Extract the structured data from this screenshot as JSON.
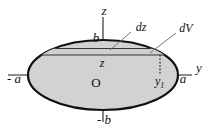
{
  "figure": {
    "background_color": "#ffffff",
    "fill_color": "#d2d2d2",
    "outline_color": "#111111",
    "axis_color": "#555555",
    "labels": {
      "z_axis": "z",
      "y_axis": "y",
      "semi_minor_top": "b",
      "semi_minor_bottom": "- b",
      "semi_major_left": "- a",
      "semi_major_right": "a",
      "origin": "O",
      "height_level": "z",
      "thickness": "dz",
      "volume_element": "dV",
      "radius_at_z": "y",
      "radius_at_z_sub": "1"
    },
    "geometry": {
      "center_x": 103,
      "center_y": 75,
      "semi_major_px": 75,
      "semi_minor_px": 35,
      "strip_top_y": 48,
      "strip_bottom_y": 55,
      "strip_right_x": 160
    }
  }
}
